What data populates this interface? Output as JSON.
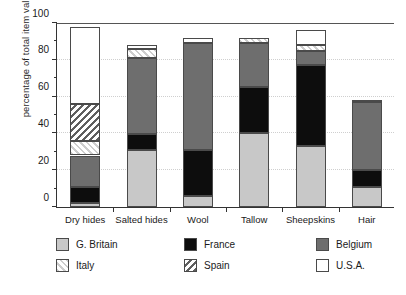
{
  "chart_data": {
    "type": "bar",
    "subtype": "stacked-bar",
    "title": "",
    "xlabel": "",
    "ylabel": "percentage of total item value",
    "ylim": [
      0,
      100
    ],
    "yticks": [
      0,
      20,
      40,
      60,
      80,
      100
    ],
    "ytick_labels": [
      "0",
      "20",
      "40",
      "60",
      "80",
      "100"
    ],
    "yminor_ticks": [
      10,
      30,
      50,
      70,
      90
    ],
    "grid": "horizontal-dotted",
    "legend_position": "below-axes",
    "categories": [
      "Dry hides",
      "Salted hides",
      "Wool",
      "Tallow",
      "Sheepskins",
      "Hair"
    ],
    "series": [
      {
        "name": "G. Britain",
        "color": "#c8c8c8",
        "pattern": "solid",
        "values": [
          2,
          31,
          6,
          40,
          33,
          11
        ]
      },
      {
        "name": "France",
        "color": "#0d0d0d",
        "pattern": "solid",
        "values": [
          9,
          8.5,
          25,
          25,
          44,
          9
        ]
      },
      {
        "name": "Belgium",
        "color": "#6e6e6e",
        "pattern": "solid",
        "values": [
          17,
          41.5,
          58,
          24,
          8,
          37
        ]
      },
      {
        "name": "Italy",
        "color": "#cdcdcd",
        "pattern": "hatch-forward",
        "values": [
          8,
          5,
          0,
          3,
          3,
          0
        ]
      },
      {
        "name": "Spain",
        "color": "#5f5f5f",
        "pattern": "hatch-back",
        "values": [
          20,
          0,
          0,
          0,
          0,
          0
        ]
      },
      {
        "name": "U.S.A.",
        "color": "#ffffff",
        "pattern": "solid",
        "values": [
          42,
          2,
          3,
          0,
          8,
          1
        ]
      }
    ],
    "totals": [
      98,
      88,
      92,
      92,
      96,
      58
    ]
  },
  "legend": {
    "items": [
      {
        "label": "G. Britain",
        "series": "G. Britain"
      },
      {
        "label": "France",
        "series": "France"
      },
      {
        "label": "Belgium",
        "series": "Belgium"
      },
      {
        "label": "Italy",
        "series": "Italy"
      },
      {
        "label": "Spain",
        "series": "Spain"
      },
      {
        "label": "U.S.A.",
        "series": "U.S.A."
      }
    ]
  }
}
